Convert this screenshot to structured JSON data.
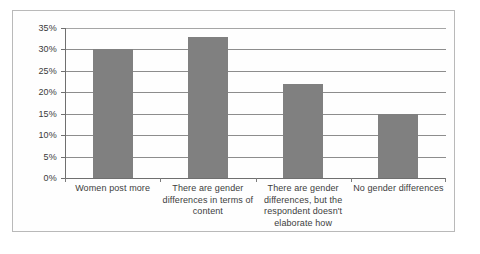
{
  "chart_data": {
    "type": "bar",
    "title": "",
    "subtitle": "",
    "xlabel": "",
    "ylabel": "",
    "categories": [
      "Women post more",
      "There are gender differences in terms of content",
      "There are gender differences, but the respondent doesn't elaborate how",
      "No gender differences"
    ],
    "category_lines": [
      [
        "Women post more"
      ],
      [
        "There are gender",
        "differences in terms of",
        "content"
      ],
      [
        "There are gender",
        "differences, but the",
        "respondent doesn't",
        "elaborate how"
      ],
      [
        "No gender differences"
      ]
    ],
    "values": [
      30,
      33,
      22,
      15
    ],
    "ylim": [
      0,
      35
    ],
    "ytick_values": [
      0,
      5,
      10,
      15,
      20,
      25,
      30,
      35
    ],
    "ytick_labels": [
      "0%",
      "5%",
      "10%",
      "15%",
      "20%",
      "25%",
      "30%",
      "35%"
    ],
    "grid": true,
    "legend": false,
    "legend_position": "none",
    "bar_color": "#808080",
    "gridline_color": "#8d8d8d",
    "axis_color": "#6f6f6f",
    "text_color": "#3d3d3d",
    "frame_color": "#b9b9b9",
    "background_color": "#ffffff"
  }
}
